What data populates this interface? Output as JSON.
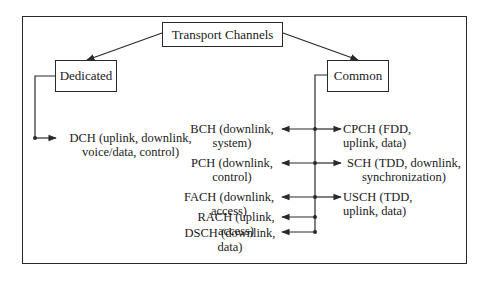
{
  "diagram": {
    "root": {
      "label": "Transport Channels"
    },
    "categories": [
      {
        "id": "dedicated",
        "label": "Dedicated"
      },
      {
        "id": "common",
        "label": "Common"
      }
    ],
    "dedicated_channels": [
      {
        "name": "DCH",
        "line1": "DCH (uplink, downlink,",
        "line2": "voice/data, control)"
      }
    ],
    "common_left_channels": [
      {
        "name": "BCH",
        "line1": "BCH (downlink,",
        "line2": "system)"
      },
      {
        "name": "PCH",
        "line1": "PCH (downlink,",
        "line2": "control)"
      },
      {
        "name": "FACH",
        "line1": "FACH (downlink,",
        "line2": "access)"
      },
      {
        "name": "RACH",
        "line1": "RACH (uplink,",
        "line2": "access)"
      },
      {
        "name": "DSCH",
        "line1": "DSCH (downlink,",
        "line2": "data)"
      }
    ],
    "common_right_channels": [
      {
        "name": "CPCH",
        "line1": "CPCH (FDD,",
        "line2": "uplink, data)"
      },
      {
        "name": "SCH",
        "line1": "SCH (TDD, downlink,",
        "line2": "synchronization)"
      },
      {
        "name": "USCH",
        "line1": "USCH (TDD,",
        "line2": "uplink, data)"
      }
    ],
    "colors": {
      "line": "#2a2a2a",
      "background": "#ffffff",
      "text": "#1a1a1a"
    }
  }
}
